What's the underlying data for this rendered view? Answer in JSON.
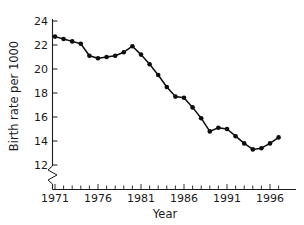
{
  "chart_data": {
    "type": "line",
    "title": "",
    "subtitle": "",
    "xlabel": "Year",
    "ylabel": "Birth rate per 1000",
    "xlim": [
      1970.3,
      1997.8
    ],
    "ylim": [
      12,
      24
    ],
    "ytick_labels": [
      "12",
      "14",
      "16",
      "18",
      "20",
      "22",
      "24"
    ],
    "ytick_values": [
      12,
      14,
      16,
      18,
      20,
      22,
      24
    ],
    "xtick_labels": [
      "1971",
      "1976",
      "1981",
      "1986",
      "1991",
      "1996"
    ],
    "xtick_values": [
      1971,
      1976,
      1981,
      1986,
      1991,
      1996
    ],
    "x_minor_ticks_every": 1,
    "grid": false,
    "legend": false,
    "legend_position": "none",
    "y_axis_break": true,
    "y_axis_break_note": "zigzag break below 12 on vertical axis",
    "marker": "filled-circle",
    "line_color": "#0d0d0d",
    "x": [
      1971,
      1972,
      1973,
      1974,
      1975,
      1976,
      1977,
      1978,
      1979,
      1980,
      1981,
      1982,
      1983,
      1984,
      1985,
      1986,
      1987,
      1988,
      1989,
      1990,
      1991,
      1992,
      1993,
      1994,
      1995,
      1996,
      1997
    ],
    "values": [
      22.7,
      22.5,
      22.3,
      22.1,
      21.1,
      20.9,
      21.0,
      21.1,
      21.4,
      21.9,
      21.2,
      20.4,
      19.5,
      18.5,
      17.7,
      17.6,
      16.8,
      15.9,
      14.8,
      15.1,
      15.0,
      14.4,
      13.8,
      13.3,
      13.4,
      13.8,
      14.3
    ],
    "series": [
      {
        "name": "Birth rate per 1000",
        "values": [
          22.7,
          22.5,
          22.3,
          22.1,
          21.1,
          20.9,
          21.0,
          21.1,
          21.4,
          21.9,
          21.2,
          20.4,
          19.5,
          18.5,
          17.7,
          17.6,
          16.8,
          15.9,
          14.8,
          15.1,
          15.0,
          14.4,
          13.8,
          13.3,
          13.4,
          13.8,
          14.3
        ]
      }
    ]
  },
  "figure": {
    "ylabel": "Birth rate per 1000",
    "xlabel": "Year"
  }
}
